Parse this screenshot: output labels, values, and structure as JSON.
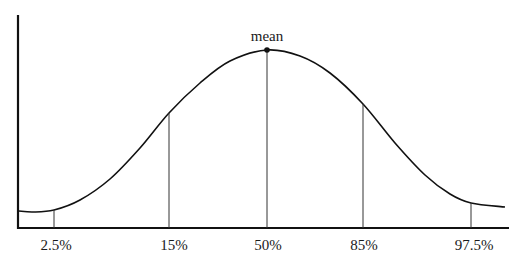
{
  "chart_data": {
    "type": "line",
    "title": "",
    "xlabel": "",
    "ylabel": "",
    "grid": false,
    "legend": null,
    "annotations": [
      {
        "text": "mean",
        "at": "50%",
        "marker": "point at curve peak"
      }
    ],
    "percentile_markers": [
      {
        "label": "2.5%",
        "x_px": 54,
        "curve_y_px": 210
      },
      {
        "label": "15%",
        "x_px": 169,
        "curve_y_px": 113
      },
      {
        "label": "50%",
        "x_px": 267,
        "curve_y_px": 50
      },
      {
        "label": "85%",
        "x_px": 363,
        "curve_y_px": 104
      },
      {
        "label": "97.5%",
        "x_px": 471,
        "curve_y_px": 203
      }
    ],
    "categories": [
      "2.5%",
      "15%",
      "50%",
      "85%",
      "97.5%"
    ],
    "series": [
      {
        "name": "density",
        "points_px": [
          [
            19,
            211
          ],
          [
            33,
            212
          ],
          [
            54,
            210
          ],
          [
            80,
            200
          ],
          [
            110,
            179
          ],
          [
            140,
            148
          ],
          [
            169,
            113
          ],
          [
            200,
            83
          ],
          [
            230,
            61
          ],
          [
            267,
            50
          ],
          [
            300,
            56
          ],
          [
            330,
            73
          ],
          [
            363,
            104
          ],
          [
            395,
            143
          ],
          [
            425,
            175
          ],
          [
            450,
            194
          ],
          [
            471,
            203
          ],
          [
            505,
            207
          ]
        ]
      }
    ],
    "axes": {
      "x_axis": {
        "x1": 18,
        "x2": 509,
        "y": 228
      },
      "y_axis": {
        "x": 18,
        "y1": 15,
        "y2": 228
      }
    }
  },
  "labels": {
    "mean": "mean",
    "ticks": [
      "2.5%",
      "15%",
      "50%",
      "85%",
      "97.5%"
    ]
  }
}
